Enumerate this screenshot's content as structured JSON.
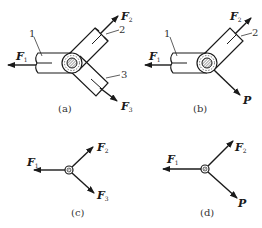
{
  "figure": {
    "panels": [
      {
        "id": "a",
        "caption": "(a)",
        "parts": [
          "1",
          "2",
          "3"
        ],
        "forces": [
          {
            "name": "F",
            "sub": "1",
            "direction": "left"
          },
          {
            "name": "F",
            "sub": "2",
            "direction": "up-right"
          },
          {
            "name": "F",
            "sub": "3",
            "direction": "down-right"
          }
        ]
      },
      {
        "id": "b",
        "caption": "(b)",
        "parts": [
          "1",
          "2"
        ],
        "forces": [
          {
            "name": "F",
            "sub": "1",
            "direction": "left"
          },
          {
            "name": "F",
            "sub": "2",
            "direction": "up-right"
          },
          {
            "name": "P",
            "sub": "",
            "direction": "down-right"
          }
        ]
      },
      {
        "id": "c",
        "caption": "(c)",
        "forces": [
          {
            "name": "F",
            "sub": "1",
            "direction": "left"
          },
          {
            "name": "F",
            "sub": "2",
            "direction": "up-right"
          },
          {
            "name": "F",
            "sub": "3",
            "direction": "down-right"
          }
        ]
      },
      {
        "id": "d",
        "caption": "(d)",
        "forces": [
          {
            "name": "F",
            "sub": "1",
            "direction": "left"
          },
          {
            "name": "F",
            "sub": "2",
            "direction": "up-right"
          },
          {
            "name": "P",
            "sub": "",
            "direction": "down-right"
          }
        ]
      }
    ],
    "colors": {
      "line": "#1a1a1a",
      "background": "#ffffff"
    }
  }
}
